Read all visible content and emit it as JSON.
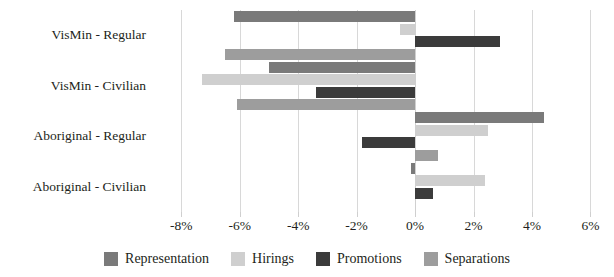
{
  "chart_data": {
    "type": "bar",
    "orientation": "horizontal",
    "title": "",
    "subtitle": "",
    "xlabel": "",
    "ylabel": "",
    "xlim": [
      -9.0,
      6.6
    ],
    "grid": true,
    "grid_axis": "x",
    "legend_position": "bottom",
    "categories": [
      "VisMin - Regular",
      "VisMin - Civilian",
      "Aboriginal - Regular",
      "Aboriginal - Civilian"
    ],
    "xticks": [
      -8,
      -6,
      -4,
      -2,
      0,
      2,
      4,
      6
    ],
    "xtick_labels": [
      "-8%",
      "-6%",
      "-4%",
      "-2%",
      "0%",
      "2%",
      "4%",
      "6%"
    ],
    "series": [
      {
        "name": "Representation",
        "color": "#7a7a7a",
        "values": [
          -6.2,
          -5.0,
          4.4,
          -0.15
        ]
      },
      {
        "name": "Hirings",
        "color": "#cfcfcf",
        "values": [
          -0.5,
          -7.3,
          2.5,
          2.4
        ]
      },
      {
        "name": "Promotions",
        "color": "#3b3b3b",
        "values": [
          2.9,
          -3.4,
          -1.8,
          0.6
        ]
      },
      {
        "name": "Separations",
        "color": "#9d9d9d",
        "values": [
          -6.5,
          -6.1,
          0.8,
          null
        ]
      }
    ]
  },
  "legend": {
    "items": [
      {
        "label": "Representation",
        "color": "#7a7a7a"
      },
      {
        "label": "Hirings",
        "color": "#cfcfcf"
      },
      {
        "label": "Promotions",
        "color": "#3b3b3b"
      },
      {
        "label": "Separations",
        "color": "#9d9d9d"
      }
    ]
  }
}
